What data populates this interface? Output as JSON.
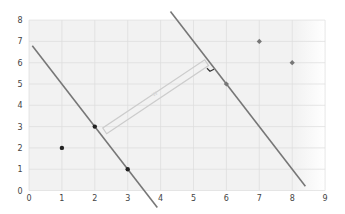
{
  "chart_data": {
    "type": "scatter",
    "title": "",
    "xlabel": "",
    "ylabel": "",
    "xlim": [
      0,
      9
    ],
    "ylim": [
      0,
      8
    ],
    "grid": true,
    "x_ticks": [
      "0",
      "1",
      "2",
      "3",
      "4",
      "5",
      "6",
      "7",
      "8",
      "9"
    ],
    "y_ticks": [
      "0",
      "1",
      "2",
      "3",
      "4",
      "5",
      "6",
      "7",
      "8"
    ],
    "series": [
      {
        "name": "class-a",
        "marker": "circle",
        "color": "#222222",
        "points": [
          [
            1,
            2
          ],
          [
            2,
            3
          ],
          [
            3,
            1
          ]
        ]
      },
      {
        "name": "class-b",
        "marker": "diamond",
        "color": "#777777",
        "points": [
          [
            6,
            5
          ],
          [
            7,
            7
          ],
          [
            8,
            6
          ]
        ]
      }
    ],
    "lines": [
      {
        "name": "support-line-1",
        "equation": "y = 7 - 2x",
        "from": [
          0.1,
          6.8
        ],
        "to": [
          3.9,
          -0.8
        ],
        "color": "#777777"
      },
      {
        "name": "support-line-2",
        "equation": "y = 17 - 2x",
        "from": [
          4.3,
          8.4
        ],
        "to": [
          8.4,
          0.2
        ],
        "color": "#777777"
      }
    ],
    "annotations": [
      {
        "type": "margin-double-arrow",
        "from": [
          2.3,
          2.8
        ],
        "to": [
          5.4,
          6.0
        ],
        "label": "w",
        "color": "#cccccc"
      },
      {
        "type": "right-angle-mark",
        "at": [
          5.5,
          5.6
        ],
        "color": "#333333"
      }
    ],
    "colors": {
      "plot_bg": "#f2f2f2",
      "grid": "#dddddd",
      "line": "#7a7a7a",
      "margin_band": "#d0d0d0"
    }
  }
}
